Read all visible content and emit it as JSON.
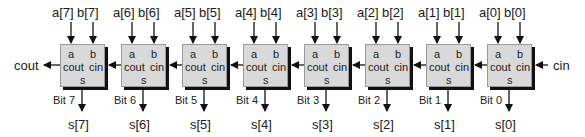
{
  "diagram": {
    "carry_out_label": "cout",
    "carry_in_label": "cin",
    "block_ports": {
      "a": "a",
      "b": "b",
      "cout": "cout",
      "cin": "cin",
      "s": "s"
    },
    "bits": [
      {
        "a": "a[7]",
        "b": "b[7]",
        "bit": "Bit 7",
        "s": "s[7]"
      },
      {
        "a": "a[6]",
        "b": "b[6]",
        "bit": "Bit 6",
        "s": "s[6]"
      },
      {
        "a": "a[5]",
        "b": "b[5]",
        "bit": "Bit 5",
        "s": "s[5]"
      },
      {
        "a": "a[4]",
        "b": "b[4]",
        "bit": "Bit 4",
        "s": "s[4]"
      },
      {
        "a": "a[3]",
        "b": "b[3]",
        "bit": "Bit 3",
        "s": "s[3]"
      },
      {
        "a": "a[2]",
        "b": "b[2]",
        "bit": "Bit 2",
        "s": "s[2]"
      },
      {
        "a": "a[1]",
        "b": "b[1]",
        "bit": "Bit 1",
        "s": "s[1]"
      },
      {
        "a": "a[0]",
        "b": "b[0]",
        "bit": "Bit 0",
        "s": "s[0]"
      }
    ],
    "colors": {
      "block_fill": "#d9d9d9",
      "block_shadow": "#111111",
      "line": "#111111"
    }
  }
}
